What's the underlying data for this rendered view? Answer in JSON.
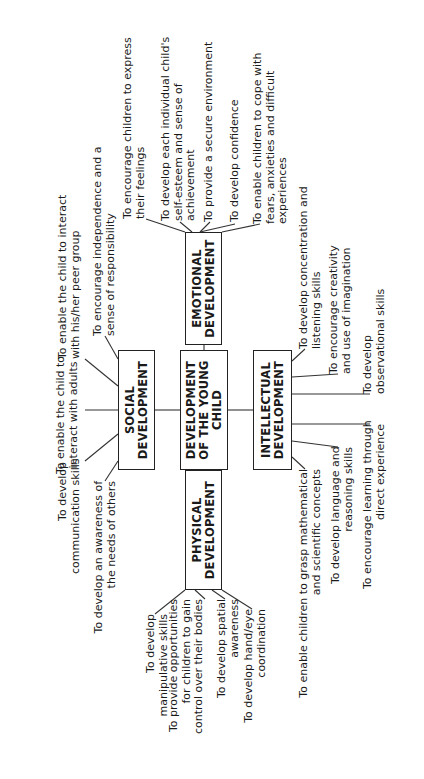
{
  "diagram": {
    "orientation": "rotated 90 degrees counter-clockwise",
    "center": {
      "label": "DEVELOPMENT\nOF THE YOUNG\nCHILD"
    },
    "social": {
      "label": "SOCIAL\nDEVELOPMENT",
      "items": [
        "To enable the child to\ninteract with adults",
        "To enable the child to interact\nwith his/her peer group",
        "To encourage independence and a\nsense of responsibility",
        "To develop\ncommunication skills",
        "To develop an awareness of\nthe needs of others"
      ]
    },
    "emotional": {
      "label": "EMOTIONAL\nDEVELOPMENT",
      "items": [
        "To encourage children to express\ntheir feelings",
        "To develop each individual child's\nself-esteem and sense of\nachievement",
        "To provide a secure environment",
        "To develop confidence",
        "To enable children to cope with\nfears, anxieties and difficult\nexperiences"
      ]
    },
    "intellectual": {
      "label": "INTELLECTUAL\nDEVELOPMENT",
      "items": [
        "To develop concentration and\nlistening skills",
        "To encourage creativity\nand use of imagination",
        "To develop\nobservational skills",
        "To encourage learning through\ndirect experience",
        "To develop language and\nreasoning skills",
        "To enable children to grasp mathematical\nand scientific concepts"
      ]
    },
    "physical": {
      "label": "PHYSICAL\nDEVELOPMENT",
      "items": [
        "To develop\nmanipulative skills",
        "To provide opportunities\nfor children to gain\ncontrol over their bodies",
        "To develop spatial\nawareness",
        "To develop hand/eye\ncoordination"
      ]
    }
  }
}
